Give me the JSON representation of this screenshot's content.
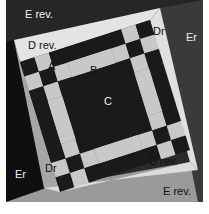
{
  "diagram": {
    "title": "",
    "colors": {
      "background": "#ffffff",
      "dark_patch": "#1a1a1a",
      "light_patch": "#c8c8c8",
      "band_light": "#e4e4e4",
      "band_mid": "#a6a6a6",
      "outer_dark": "#2b2b2b",
      "outer_mid": "#9a9a9a",
      "label_light": "#f2f2f2",
      "label_dark": "#111111"
    },
    "labels": {
      "e_rev_top": "E rev.",
      "e_rev_bottom": "E rev.",
      "d_rev_top": "D rev.",
      "d_rev_bottom": "D rev.",
      "dr_right": "Dr",
      "dr_left": "Dr",
      "er_right": "Er",
      "er_left": "Er",
      "patch_a": "A",
      "patch_b": "B",
      "patch_c": "C"
    },
    "grid_units": 9
  }
}
